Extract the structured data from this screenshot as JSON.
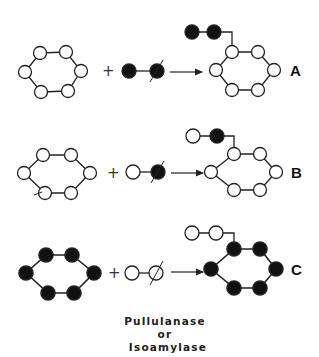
{
  "figure": {
    "rows": [
      {
        "id": "A",
        "label": "A",
        "y": 71,
        "acceptor_fill": "open",
        "donor": [
          "filled",
          "filled"
        ],
        "product_chain": [
          "filled",
          "filled"
        ],
        "product_ring_fill": "open"
      },
      {
        "id": "B",
        "label": "B",
        "y": 173,
        "acceptor_fill": "open",
        "donor": [
          "open",
          "filled"
        ],
        "product_chain": [
          "open",
          "filled"
        ],
        "product_ring_fill": "open"
      },
      {
        "id": "C",
        "label": "C",
        "y": 271,
        "acceptor_fill": "filled",
        "donor": [
          "open",
          "open"
        ],
        "product_chain": [
          "open",
          "open"
        ],
        "product_ring_fill": "filled"
      }
    ],
    "plus_symbol": "+",
    "enzyme_caption": [
      "Pullulanase",
      "or",
      "Isoamylase"
    ],
    "colors": {
      "stroke": "#222222",
      "filled": "#111111",
      "open": "#ffffff"
    }
  }
}
